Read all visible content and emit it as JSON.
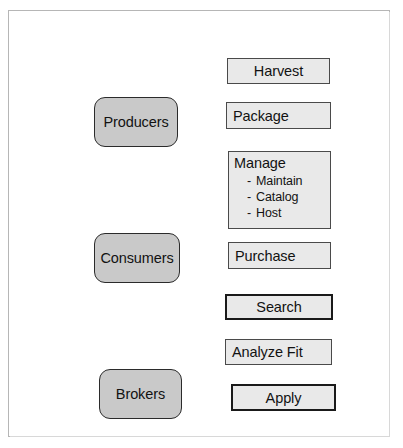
{
  "diagram": {
    "frame": {
      "border_color": "#b6b6b6",
      "background": "#ffffff"
    },
    "colors": {
      "actor_fill": "#c9c9c9",
      "actor_border": "#2b2b2b",
      "activity_fill": "#e9e9e9",
      "activity_border": "#4a4a4a",
      "activity_border_bold": "#1a1a1a",
      "text": "#121212"
    },
    "actors": [
      {
        "id": "producers",
        "label": "Producers"
      },
      {
        "id": "consumers",
        "label": "Consumers"
      },
      {
        "id": "brokers",
        "label": "Brokers"
      }
    ],
    "activities": [
      {
        "id": "harvest",
        "label": "Harvest",
        "align": "center",
        "bold_border": false
      },
      {
        "id": "package",
        "label": "Package",
        "align": "left",
        "bold_border": false
      },
      {
        "id": "manage",
        "label": "Manage",
        "align": "left",
        "bold_border": false,
        "sublist": [
          {
            "dash": "-",
            "label": "Maintain"
          },
          {
            "dash": "-",
            "label": "Catalog"
          },
          {
            "dash": "-",
            "label": "Host"
          }
        ]
      },
      {
        "id": "purchase",
        "label": "Purchase",
        "align": "left",
        "bold_border": false
      },
      {
        "id": "search",
        "label": "Search",
        "align": "center",
        "bold_border": true
      },
      {
        "id": "analyze",
        "label": "Analyze Fit",
        "align": "left",
        "bold_border": false
      },
      {
        "id": "apply",
        "label": "Apply",
        "align": "center",
        "bold_border": true
      }
    ]
  }
}
